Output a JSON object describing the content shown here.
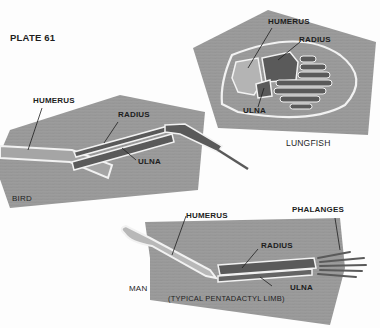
{
  "plate": {
    "title": "PLATE 61"
  },
  "colors": {
    "background": "#fdfdfd",
    "muscle": "#9a9a9a",
    "muscle_light": "#a8a8a8",
    "bone_dark": "#595959",
    "bone_light": "#b8b8b8",
    "outline": "#f2f2f2",
    "label": "#1e1e1e"
  },
  "panels": {
    "lungfish": {
      "name": "LUNGFISH",
      "labels": {
        "humerus": "HUMERUS",
        "radius": "RADIUS",
        "ulna": "ULNA"
      }
    },
    "bird": {
      "name": "BIRD",
      "labels": {
        "humerus": "HUMERUS",
        "radius": "RADIUS",
        "ulna": "ULNA"
      }
    },
    "man": {
      "name": "MAN",
      "caption": "(TYPICAL  PENTADACTYL  LIMB)",
      "labels": {
        "humerus": "HUMERUS",
        "radius": "RADIUS",
        "ulna": "ULNA",
        "phalanges": "PHALANGES"
      }
    }
  }
}
